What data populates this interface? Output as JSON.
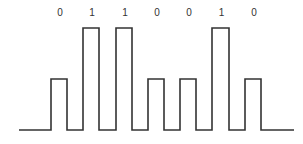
{
  "diagram": {
    "type": "pulse-amplitude waveform",
    "bits": [
      "0",
      "1",
      "1",
      "0",
      "0",
      "1",
      "0"
    ],
    "colors": {
      "line": "#333333",
      "label": "#333333",
      "background": "#ffffff"
    },
    "levels": {
      "baseline_y": 130,
      "zero_pulse_top_y": 79,
      "one_pulse_top_y": 28
    },
    "pulses": [
      {
        "bit": "0",
        "x_start": 51,
        "x_end": 67
      },
      {
        "bit": "1",
        "x_start": 83,
        "x_end": 99
      },
      {
        "bit": "1",
        "x_start": 116,
        "x_end": 132
      },
      {
        "bit": "0",
        "x_start": 148,
        "x_end": 164
      },
      {
        "bit": "0",
        "x_start": 180,
        "x_end": 196
      },
      {
        "bit": "1",
        "x_start": 212,
        "x_end": 229
      },
      {
        "bit": "0",
        "x_start": 245,
        "x_end": 261
      }
    ],
    "baseline": {
      "x_start": 19,
      "x_end": 294
    }
  }
}
